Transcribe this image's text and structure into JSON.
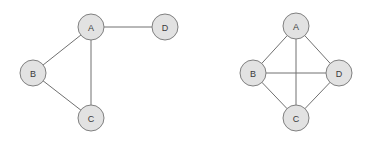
{
  "figure": {
    "title": "",
    "background_color": "#ffffff",
    "width": 377,
    "height": 149
  },
  "style": {
    "node_fill": "#e2e2e2",
    "node_stroke": "#808080",
    "node_stroke_width": 1,
    "node_radius": 13,
    "edge_color": "#707070",
    "edge_width": 1,
    "label_color": "#3a3a3a",
    "label_font_size": 9
  },
  "chart_data": {
    "type": "diagram",
    "subtype": "node-link-graph",
    "title": "",
    "xlabel": "",
    "ylabel": "",
    "grid": false,
    "legend": "none",
    "graphs": [
      {
        "id": "graph-left",
        "name": "left-graph",
        "caption": "",
        "directed": false,
        "node_count": 4,
        "edge_count": 4,
        "nodes": [
          {
            "id": "A",
            "label": "A",
            "x": 91,
            "y": 27,
            "degree": 3
          },
          {
            "id": "B",
            "label": "B",
            "x": 33,
            "y": 73,
            "degree": 2
          },
          {
            "id": "C",
            "label": "C",
            "x": 91,
            "y": 118,
            "degree": 2
          },
          {
            "id": "D",
            "label": "D",
            "x": 165,
            "y": 27,
            "degree": 1
          }
        ],
        "edges": [
          {
            "source": "A",
            "target": "D",
            "label": ""
          },
          {
            "source": "A",
            "target": "B",
            "label": ""
          },
          {
            "source": "A",
            "target": "C",
            "label": ""
          },
          {
            "source": "B",
            "target": "C",
            "label": ""
          }
        ]
      },
      {
        "id": "graph-right",
        "name": "right-graph",
        "caption": "",
        "directed": false,
        "node_count": 4,
        "edge_count": 6,
        "nodes": [
          {
            "id": "A",
            "label": "A",
            "x": 296,
            "y": 26,
            "degree": 3
          },
          {
            "id": "B",
            "label": "B",
            "x": 253,
            "y": 73,
            "degree": 3
          },
          {
            "id": "C",
            "label": "C",
            "x": 296,
            "y": 118,
            "degree": 3
          },
          {
            "id": "D",
            "label": "D",
            "x": 339,
            "y": 73,
            "degree": 3
          }
        ],
        "edges": [
          {
            "source": "A",
            "target": "B",
            "label": ""
          },
          {
            "source": "A",
            "target": "D",
            "label": ""
          },
          {
            "source": "A",
            "target": "C",
            "label": ""
          },
          {
            "source": "B",
            "target": "D",
            "label": ""
          },
          {
            "source": "B",
            "target": "C",
            "label": ""
          },
          {
            "source": "C",
            "target": "D",
            "label": ""
          }
        ]
      }
    ]
  }
}
